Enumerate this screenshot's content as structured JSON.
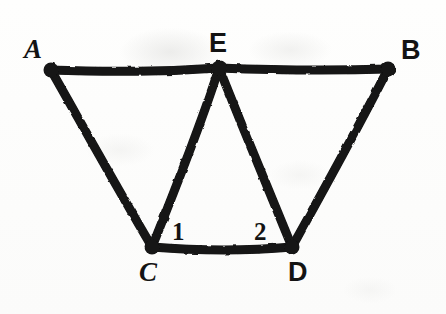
{
  "figure": {
    "background_color": "#fdfdfc",
    "ink_color": "#131313",
    "stroke_width": 9,
    "canvas": {
      "width": 446,
      "height": 314
    }
  },
  "vertices": [
    {
      "id": "A",
      "label": "A",
      "x": 51,
      "y": 70,
      "label_x": 24,
      "label_y": 36,
      "style": "italic"
    },
    {
      "id": "E",
      "label": "E",
      "x": 219,
      "y": 68,
      "label_x": 209,
      "label_y": 30,
      "style": "upright"
    },
    {
      "id": "B",
      "label": "B",
      "x": 388,
      "y": 69,
      "label_x": 401,
      "label_y": 37,
      "style": "upright"
    },
    {
      "id": "C",
      "label": "C",
      "x": 152,
      "y": 247,
      "label_x": 139,
      "label_y": 259,
      "style": "italic"
    },
    {
      "id": "D",
      "label": "D",
      "x": 292,
      "y": 247,
      "label_x": 288,
      "label_y": 259,
      "style": "upright"
    }
  ],
  "edges": [
    {
      "id": "AE",
      "from": "A",
      "to": "E"
    },
    {
      "id": "EB",
      "from": "E",
      "to": "B"
    },
    {
      "id": "AC",
      "from": "A",
      "to": "C"
    },
    {
      "id": "EC",
      "from": "E",
      "to": "C"
    },
    {
      "id": "ED",
      "from": "E",
      "to": "D"
    },
    {
      "id": "BD",
      "from": "B",
      "to": "D"
    },
    {
      "id": "CD",
      "from": "C",
      "to": "D"
    }
  ],
  "angle_labels": [
    {
      "id": "angle-1",
      "label": "1",
      "x": 172,
      "y": 219,
      "at_vertex": "C"
    },
    {
      "id": "angle-2",
      "label": "2",
      "x": 254,
      "y": 219,
      "at_vertex": "D"
    }
  ]
}
